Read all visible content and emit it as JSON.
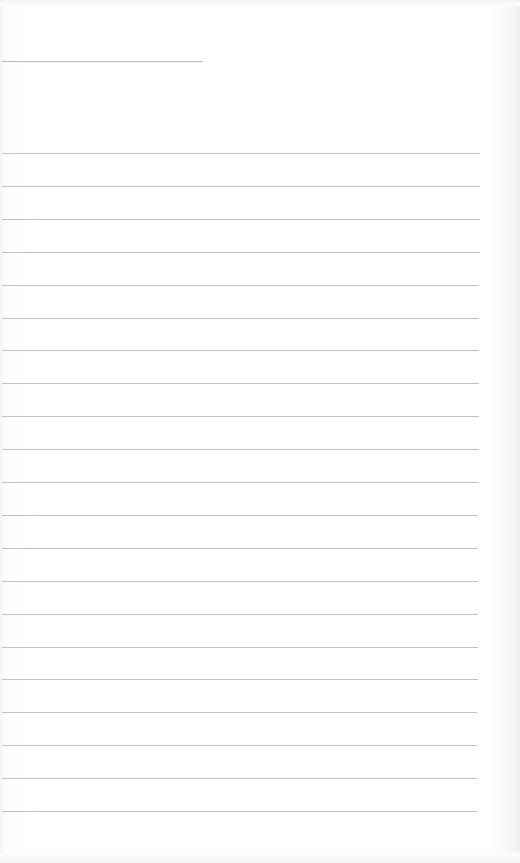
{
  "document": {
    "type": "lined-sheet",
    "header_line_count": 1,
    "ruled_line_count": 21,
    "text_content": []
  },
  "colors": {
    "paper": "#ffffff",
    "header_line": "#b8b8b8",
    "ruled_line": "#c2c2c2"
  }
}
